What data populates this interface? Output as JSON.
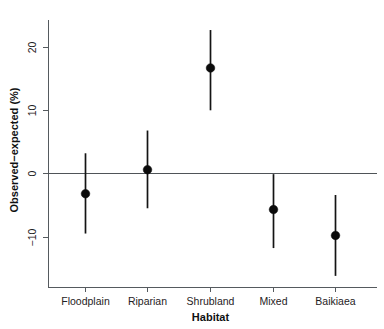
{
  "chart_data": {
    "type": "scatter",
    "title": "",
    "subtitle": "",
    "xlabel": "Habitat",
    "ylabel": "Observed−expected (%)",
    "categories": [
      "Floodplain",
      "Riparian",
      "Shrubland",
      "Mixed",
      "Baikiaea"
    ],
    "values": [
      -3.2,
      0.6,
      16.7,
      -5.7,
      -9.8
    ],
    "error_low": [
      -9.5,
      -5.5,
      10.0,
      -11.8,
      -16.2
    ],
    "error_high": [
      3.2,
      6.8,
      22.7,
      -0.1,
      -3.4
    ],
    "series": [
      {
        "name": "Observed−expected (%)",
        "values": [
          -3.2,
          0.6,
          16.7,
          -5.7,
          -9.8
        ],
        "error_low": [
          -9.5,
          -5.5,
          10.0,
          -11.8,
          -16.2
        ],
        "error_high": [
          3.2,
          6.8,
          22.7,
          -0.1,
          -3.4
        ]
      }
    ],
    "points": [
      {
        "category": "Floodplain",
        "value": -3.2,
        "low": -9.5,
        "high": 3.2
      },
      {
        "category": "Riparian",
        "value": 0.6,
        "low": -5.5,
        "high": 6.8
      },
      {
        "category": "Shrubland",
        "value": 16.7,
        "low": 10.0,
        "high": 22.7
      },
      {
        "category": "Mixed",
        "value": -5.7,
        "low": -11.8,
        "high": -0.1
      },
      {
        "category": "Baikiaea",
        "value": -9.8,
        "low": -16.2,
        "high": -3.4
      }
    ],
    "ylim": [
      -17.5,
      24.0
    ],
    "yticks": [
      -10,
      0,
      10,
      20
    ],
    "ytick_labels": [
      "−10",
      "0",
      "10",
      "20"
    ],
    "xticks": [
      "Floodplain",
      "Riparian",
      "Shrubland",
      "Mixed",
      "Baikiaea"
    ],
    "grid": false,
    "legend": null,
    "reference_line": 0,
    "annotations": [],
    "colors": {
      "marker": "#0b0b0b",
      "errorbar": "#141414",
      "axis": "#555a5e",
      "zero_line": "#4f5458",
      "background": "#ffffff",
      "text": "#1f2224"
    }
  },
  "axes": {
    "y_title": "Observed−expected (%)",
    "x_title": "Habitat",
    "y_tick_labels": [
      "20",
      "10",
      "0",
      "−10"
    ],
    "x_tick_labels": [
      "Floodplain",
      "Riparian",
      "Shrubland",
      "Mixed",
      "Baikiaea"
    ]
  }
}
